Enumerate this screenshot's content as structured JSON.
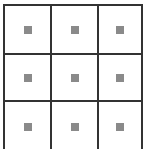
{
  "grid": {
    "rows": 3,
    "columns": 3,
    "line_color": "#333333",
    "marker_color": "#8a8a8a",
    "cells": [
      {
        "row": 0,
        "col": 0,
        "marker": "gray-square"
      },
      {
        "row": 0,
        "col": 1,
        "marker": "gray-square"
      },
      {
        "row": 0,
        "col": 2,
        "marker": "gray-square"
      },
      {
        "row": 1,
        "col": 0,
        "marker": "gray-square"
      },
      {
        "row": 1,
        "col": 1,
        "marker": "gray-square"
      },
      {
        "row": 1,
        "col": 2,
        "marker": "gray-square"
      },
      {
        "row": 2,
        "col": 0,
        "marker": "gray-square"
      },
      {
        "row": 2,
        "col": 1,
        "marker": "gray-square"
      },
      {
        "row": 2,
        "col": 2,
        "marker": "gray-square"
      }
    ]
  }
}
